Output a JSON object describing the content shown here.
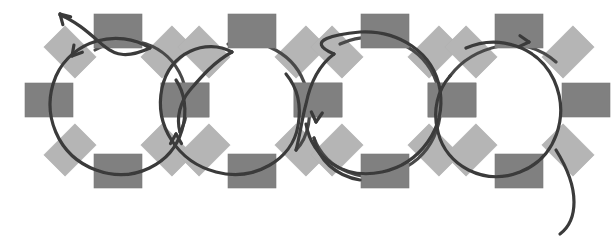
{
  "figure": {
    "title": "Chromatin fiber schematic: chain of four nucleosome-like rings wrapped by a continuous strand",
    "caption": "",
    "background_color": "#ffffff",
    "width": 612,
    "height": 244
  },
  "palette": {
    "dark_block": "#808080",
    "dark_block_edge": "#7a7a7a",
    "light_block": "#b5b5b5",
    "light_block_edge": "#b0b0b0",
    "strand": "#3a3a3a",
    "strand_secondary": "#4a4a4a",
    "background": "#ffffff"
  },
  "geometry": {
    "block_width": 48,
    "block_height": 34,
    "light_block_width": 44,
    "light_block_height": 30,
    "light_block_rotation_deg": 45,
    "ring_radius": 67,
    "strand_width": 3.2
  },
  "rings": [
    {
      "id": "ring-1",
      "label": "nucleosome-1",
      "center_x": 118,
      "center_y": 100,
      "radius": 67,
      "blocks": [
        {
          "id": "r1-top",
          "role": "dark",
          "cx": 118,
          "cy": 31,
          "rot": 0
        },
        {
          "id": "r1-right",
          "role": "dark",
          "cx": 185,
          "cy": 100,
          "rot": 0
        },
        {
          "id": "r1-bottom",
          "role": "dark",
          "cx": 118,
          "cy": 171,
          "rot": 0
        },
        {
          "id": "r1-left",
          "role": "dark",
          "cx": 49,
          "cy": 100,
          "rot": 0
        },
        {
          "id": "r1-tl",
          "role": "light",
          "cx": 70,
          "cy": 52,
          "rot": 45
        },
        {
          "id": "r1-tr",
          "role": "light",
          "cx": 167,
          "cy": 52,
          "rot": -45
        },
        {
          "id": "r1-br",
          "role": "light",
          "cx": 167,
          "cy": 150,
          "rot": 45
        },
        {
          "id": "r1-bl",
          "role": "light",
          "cx": 70,
          "cy": 150,
          "rot": -45
        }
      ]
    },
    {
      "id": "ring-2",
      "label": "nucleosome-2",
      "center_x": 252,
      "center_y": 100,
      "radius": 67,
      "blocks": [
        {
          "id": "r2-top",
          "role": "dark",
          "cx": 252,
          "cy": 31,
          "rot": 0
        },
        {
          "id": "r2-right",
          "role": "dark",
          "cx": 318,
          "cy": 100,
          "rot": 0
        },
        {
          "id": "r2-bottom",
          "role": "dark",
          "cx": 252,
          "cy": 171,
          "rot": 0
        },
        {
          "id": "r2-left",
          "role": "dark",
          "cx": 185,
          "cy": 100,
          "rot": 0
        },
        {
          "id": "r2-tl",
          "role": "light",
          "cx": 204,
          "cy": 52,
          "rot": 45
        },
        {
          "id": "r2-tr",
          "role": "light",
          "cx": 301,
          "cy": 52,
          "rot": -45
        },
        {
          "id": "r2-br",
          "role": "light",
          "cx": 301,
          "cy": 150,
          "rot": 45
        },
        {
          "id": "r2-bl",
          "role": "light",
          "cx": 204,
          "cy": 150,
          "rot": -45
        }
      ]
    },
    {
      "id": "ring-3",
      "label": "nucleosome-3",
      "center_x": 385,
      "center_y": 100,
      "radius": 67,
      "blocks": [
        {
          "id": "r3-top",
          "role": "dark",
          "cx": 385,
          "cy": 31,
          "rot": 0
        },
        {
          "id": "r3-right",
          "role": "dark",
          "cx": 452,
          "cy": 100,
          "rot": 0
        },
        {
          "id": "r3-bottom",
          "role": "dark",
          "cx": 385,
          "cy": 171,
          "rot": 0
        },
        {
          "id": "r3-left",
          "role": "dark",
          "cx": 318,
          "cy": 100,
          "rot": 0
        },
        {
          "id": "r3-tl",
          "role": "light",
          "cx": 337,
          "cy": 52,
          "rot": 45
        },
        {
          "id": "r3-tr",
          "role": "light",
          "cx": 434,
          "cy": 52,
          "rot": -45
        },
        {
          "id": "r3-br",
          "role": "light",
          "cx": 434,
          "cy": 150,
          "rot": 45
        },
        {
          "id": "r3-bl",
          "role": "light",
          "cx": 337,
          "cy": 150,
          "rot": -45
        }
      ]
    },
    {
      "id": "ring-4",
      "label": "nucleosome-4",
      "center_x": 519,
      "center_y": 100,
      "radius": 67,
      "blocks": [
        {
          "id": "r4-top",
          "role": "dark",
          "cx": 519,
          "cy": 31,
          "rot": 0
        },
        {
          "id": "r4-right",
          "role": "dark",
          "cx": 586,
          "cy": 100,
          "rot": 0
        },
        {
          "id": "r4-bottom",
          "role": "dark",
          "cx": 519,
          "cy": 171,
          "rot": 0
        },
        {
          "id": "r4-left",
          "role": "dark",
          "cx": 452,
          "cy": 100,
          "rot": 0
        },
        {
          "id": "r4-tl",
          "role": "light",
          "cx": 471,
          "cy": 52,
          "rot": 45
        },
        {
          "id": "r4-tr",
          "role": "light",
          "cx": 568,
          "cy": 52,
          "rot": -45
        },
        {
          "id": "r4-br",
          "role": "light",
          "cx": 568,
          "cy": 150,
          "rot": 45
        },
        {
          "id": "r4-bl",
          "role": "light",
          "cx": 471,
          "cy": 150,
          "rot": -45
        }
      ]
    }
  ],
  "strand": {
    "description": "Continuous dark strand entering top-left with an arrowhead, winding around each of the four rings and exiting at bottom-right.",
    "free_end_start": {
      "x": 58,
      "y": 13
    },
    "free_end_tail": {
      "x": 572,
      "y": 233
    },
    "segments": [
      {
        "id": "seg-lead-in",
        "path": "M 60,15 C 78,22 92,36 104,46 C 116,56 128,58 150,48"
      },
      {
        "id": "seg-ring1-a",
        "path": "M 150,48 C 118,28 72,40 56,76 C 40,114 58,156 96,170 C 134,184 172,164 182,130 C 188,110 184,92 176,80"
      },
      {
        "id": "seg-ring1-b",
        "path": "M 95,50 C 128,30 168,44 182,78 C 190,98 188,118 180,132"
      },
      {
        "id": "seg-link-12",
        "path": "M 180,132 C 176,118 180,102 190,90 C 202,76 214,62 232,52"
      },
      {
        "id": "seg-ring2-a",
        "path": "M 232,52 C 206,38 170,52 162,88 C 154,126 178,162 216,172 C 254,182 292,160 298,126 C 302,104 296,86 286,74"
      },
      {
        "id": "seg-ring2-b",
        "path": "M 228,44 C 262,36 296,54 306,88 C 314,114 308,138 296,150"
      },
      {
        "id": "seg-link-23",
        "path": "M 296,150 C 300,136 302,118 306,104 C 310,84 318,66 334,54"
      },
      {
        "id": "seg-ring3-a",
        "path": "M 334,54 C 302,40 338,34 360,32 C 398,30 434,52 440,90 C 446,128 420,164 382,172 C 344,180 312,158 306,124"
      },
      {
        "id": "seg-ring3-b",
        "path": "M 340,44 C 376,28 418,42 434,76 C 450,112 436,154 400,170 C 364,186 326,170 314,138"
      },
      {
        "id": "seg-link-34",
        "path": "M 314,138 C 318,160 336,176 360,180"
      },
      {
        "id": "seg-ring4-a",
        "path": "M 466,48 C 498,34 538,46 554,80 C 570,116 556,158 520,172 C 484,186 446,166 438,132 C 432,110 438,90 450,76"
      },
      {
        "id": "seg-ring4-b",
        "path": "M 450,76 C 462,60 480,50 500,46 C 520,42 540,48 556,62"
      },
      {
        "id": "seg-tail-out",
        "path": "M 556,150 C 566,166 574,184 574,202 C 574,218 568,228 560,234"
      }
    ],
    "arrowheads": [
      {
        "id": "arrow-lead-in",
        "x": 60,
        "y": 14,
        "angle_deg": -135,
        "direction": "up-left"
      },
      {
        "id": "arrow-ring1",
        "x": 72,
        "y": 56,
        "angle_deg": 130,
        "direction": "down-left"
      },
      {
        "id": "arrow-ring2",
        "x": 176,
        "y": 134,
        "angle_deg": -90,
        "direction": "up"
      },
      {
        "id": "arrow-ring3",
        "x": 316,
        "y": 122,
        "angle_deg": 95,
        "direction": "down"
      },
      {
        "id": "arrow-ring4",
        "x": 529,
        "y": 42,
        "angle_deg": 5,
        "direction": "right"
      }
    ]
  }
}
